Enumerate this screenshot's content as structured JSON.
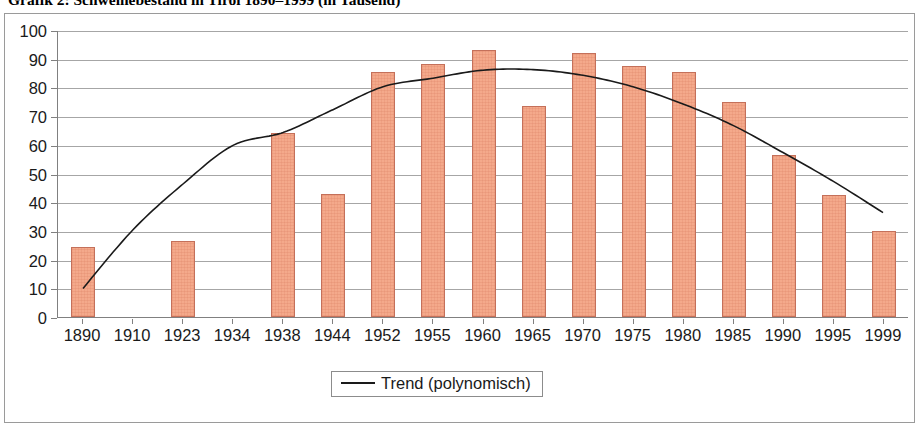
{
  "chart_data": {
    "type": "bar",
    "title": "Grafik 2: Schweinebestand in Tirol 1890–1999 (in Tausend)",
    "xlabel": "",
    "ylabel": "",
    "ylim": [
      0,
      100
    ],
    "ytick_step": 10,
    "yticks": [
      "100",
      "90",
      "80",
      "70",
      "60",
      "50",
      "40",
      "30",
      "20",
      "10",
      "0"
    ],
    "grid": true,
    "legend_position": "bottom-center",
    "categories": [
      "1890",
      "1910",
      "1923",
      "1934",
      "1938",
      "1944",
      "1952",
      "1955",
      "1960",
      "1965",
      "1970",
      "1975",
      "1980",
      "1985",
      "1990",
      "1995",
      "1999"
    ],
    "values": [
      24.5,
      null,
      26.5,
      null,
      64,
      43,
      85.5,
      88,
      93,
      73.5,
      92,
      87.5,
      85.5,
      75,
      56.5,
      42.5,
      30
    ],
    "series": [
      {
        "name": "Schweinebestand",
        "type": "bar",
        "color": "#f4a98b",
        "border_color": "#c4705a",
        "values": [
          24.5,
          null,
          26.5,
          null,
          64,
          43,
          85.5,
          88,
          93,
          73.5,
          92,
          87.5,
          85.5,
          75,
          56.5,
          42.5,
          30
        ]
      },
      {
        "name": "Trend (polynomisch)",
        "type": "line",
        "color": "#1a1a1a",
        "values": [
          10,
          30.5,
          46.5,
          60,
          64.5,
          72.5,
          80.5,
          83.5,
          86.3,
          86.5,
          84.5,
          80.5,
          74.5,
          67,
          57.5,
          47.5,
          36.5
        ]
      }
    ],
    "legend": [
      {
        "label": "Trend (polynomisch)",
        "marker": "line",
        "color": "#1a1a1a"
      }
    ]
  },
  "legend": {
    "trend_label": "Trend (polynomisch)"
  },
  "colors": {
    "bar_fill": "#f4a98b",
    "bar_border": "#c4705a",
    "trend_line": "#1a1a1a",
    "gridline": "#a6a6a6",
    "axis": "#808080",
    "frame": "#9a9a9a"
  }
}
